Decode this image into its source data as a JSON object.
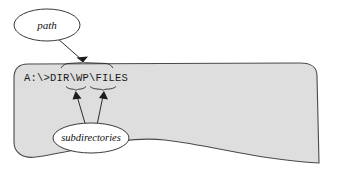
{
  "figure": {
    "type": "annotated-diagram",
    "background_color": "#ffffff",
    "blob": {
      "label": "screen-area",
      "fill_color": "#dedede",
      "stroke_color": "#4a4a4a"
    },
    "command_line": {
      "text": "A:\\>DIR\\WP\\FILES",
      "font": "monospace",
      "segments": [
        {
          "name": "path-segment",
          "text": "DIR\\WP\\FILES"
        },
        {
          "name": "subdirectory-wp",
          "text": "WP"
        },
        {
          "name": "subdirectory-files",
          "text": "FILES"
        }
      ]
    },
    "callouts": [
      {
        "name": "path-callout",
        "label": "path",
        "style": "italic",
        "points_to": "path-segment"
      },
      {
        "name": "subdirectories-callout",
        "label": "subdirectories",
        "style": "italic",
        "points_to": "subdirectory-wp, subdirectory-files"
      }
    ]
  }
}
